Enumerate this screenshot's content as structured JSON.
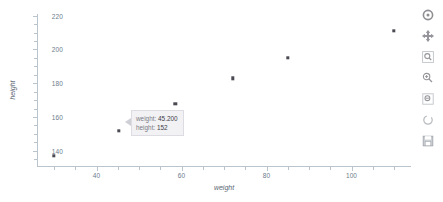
{
  "chart_data": {
    "type": "scatter",
    "title": "",
    "xlabel": "weight",
    "ylabel": "height",
    "xlim": [
      26,
      114
    ],
    "ylim": [
      131,
      221
    ],
    "grid": false,
    "legend": "none",
    "xticks": [
      40,
      60,
      80,
      100
    ],
    "xticklabels": [
      "40",
      "60",
      "80",
      "100"
    ],
    "yticks": [
      140,
      160,
      180,
      200,
      220
    ],
    "yticklabels": [
      "140",
      "160",
      "180",
      "200",
      "220"
    ],
    "marker_color": "#4a4a52",
    "series": [
      {
        "name": "height vs weight",
        "points": [
          {
            "x": 30.0,
            "y": 137
          },
          {
            "x": 45.2,
            "y": 152
          },
          {
            "x": 58.5,
            "y": 168
          },
          {
            "x": 72.0,
            "y": 183
          },
          {
            "x": 85.0,
            "y": 195
          },
          {
            "x": 110.0,
            "y": 211
          }
        ]
      }
    ]
  },
  "hover": {
    "visible": true,
    "rows": [
      {
        "key": "weight:",
        "value": "45.200"
      },
      {
        "key": "height:",
        "value": "152"
      }
    ]
  },
  "modebar": {
    "buttons": [
      {
        "name": "plotly-logo-icon",
        "label": "Produced with Plotly"
      },
      {
        "name": "pan-icon",
        "label": "Pan"
      },
      {
        "name": "zoom-icon",
        "label": "Zoom"
      },
      {
        "name": "zoom-in-icon",
        "label": "Zoom in"
      },
      {
        "name": "zoom-out-icon",
        "label": "Zoom out"
      },
      {
        "name": "autoscale-icon",
        "label": "Autoscale"
      },
      {
        "name": "reset-axes-icon",
        "label": "Reset axes"
      }
    ]
  }
}
